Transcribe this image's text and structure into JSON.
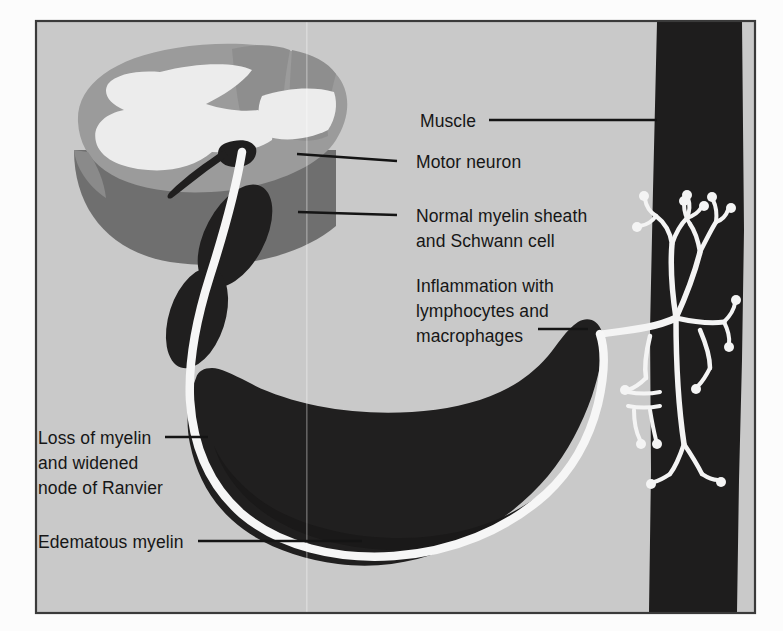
{
  "figure": {
    "kind": "medical-illustration",
    "background_color": "#c9c9c9",
    "page_color": "#fcfcfc",
    "frame_color": "#3a3a3a",
    "ink_color": "#161616"
  },
  "palette": {
    "grey_matter": "#ececec",
    "white_matter": "#9b9b9b",
    "cord_shadow": "#6f6f6f",
    "cord_edge": "#8a8a8a",
    "myelin_dark": "#201f1f",
    "muscle_dark": "#1e1d1d",
    "axon_white": "#f6f6f6",
    "nerve_terminal": "#f4f4f4"
  },
  "labels": [
    {
      "id": "muscle",
      "text": "Muscle",
      "lines": [
        "Muscle"
      ],
      "x": 420,
      "y": 125,
      "anchor": "start",
      "leader": {
        "from_x": 489,
        "from_y": 120,
        "to_x": 657,
        "to_y": 120
      }
    },
    {
      "id": "motor-neuron",
      "text": "Motor neuron",
      "lines": [
        "Motor neuron"
      ],
      "x": 416,
      "y": 167,
      "anchor": "start",
      "leader": {
        "from_x": 397,
        "from_y": 161,
        "to_x": 297,
        "to_y": 154
      }
    },
    {
      "id": "normal-myelin",
      "text": "Normal myelin sheath and Schwann cell",
      "lines": [
        "Normal myelin sheath",
        "and Schwann cell"
      ],
      "x": 416,
      "y": 220,
      "anchor": "start",
      "leader": {
        "from_x": 397,
        "from_y": 215,
        "to_x": 298,
        "to_y": 212
      }
    },
    {
      "id": "inflammation",
      "text": "Inflammation with lymphocytes and macrophages",
      "lines": [
        "Inflammation with",
        "lymphocytes and",
        "macrophages"
      ],
      "x": 416,
      "y": 288,
      "anchor": "start",
      "leader": {
        "from_x": 538,
        "from_y": 329,
        "to_x": 588,
        "to_y": 329
      }
    },
    {
      "id": "loss-of-myelin",
      "text": "Loss of myelin and widened node of Ranvier",
      "lines": [
        "Loss of myelin",
        "and widened",
        "node of Ranvier"
      ],
      "x": 38,
      "y": 442,
      "anchor": "start",
      "leader": {
        "from_x": 165,
        "from_y": 437,
        "to_x": 208,
        "to_y": 437
      }
    },
    {
      "id": "edematous-myelin",
      "text": "Edematous myelin",
      "lines": [
        "Edematous myelin"
      ],
      "x": 38,
      "y": 546,
      "anchor": "start",
      "leader": {
        "from_x": 198,
        "from_y": 541,
        "to_x": 362,
        "to_y": 541
      }
    }
  ],
  "frame": {
    "x": 36,
    "y": 21,
    "width": 719,
    "height": 592
  }
}
